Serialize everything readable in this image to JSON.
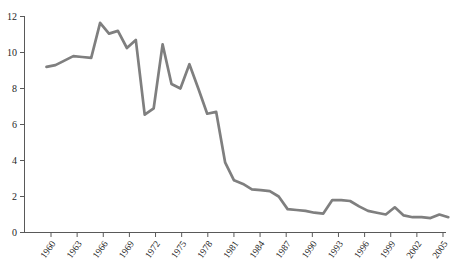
{
  "chart_data": {
    "type": "line",
    "title": "",
    "xlabel": "",
    "ylabel": "",
    "x": [
      1960,
      1961,
      1962,
      1963,
      1964,
      1965,
      1966,
      1967,
      1968,
      1969,
      1970,
      1971,
      1972,
      1973,
      1974,
      1975,
      1976,
      1977,
      1978,
      1979,
      1980,
      1981,
      1982,
      1983,
      1984,
      1985,
      1986,
      1987,
      1988,
      1989,
      1990,
      1991,
      1992,
      1993,
      1994,
      1995,
      1996,
      1997,
      1998,
      1999,
      2000,
      2001,
      2002,
      2003,
      2004,
      2005
    ],
    "values": [
      9.2,
      9.3,
      9.55,
      9.8,
      9.75,
      9.7,
      11.65,
      11.05,
      11.2,
      10.25,
      10.7,
      6.55,
      6.9,
      10.45,
      8.25,
      8.0,
      9.35,
      8.0,
      6.6,
      6.7,
      3.9,
      2.9,
      2.7,
      2.4,
      2.35,
      2.3,
      2.0,
      1.3,
      1.25,
      1.2,
      1.1,
      1.05,
      1.8,
      1.8,
      1.75,
      1.45,
      1.2,
      1.1,
      1.0,
      1.4,
      0.95,
      0.85,
      0.85,
      0.8,
      1.0,
      0.85
    ],
    "xticks": [
      1960,
      1963,
      1966,
      1969,
      1972,
      1975,
      1978,
      1981,
      1984,
      1987,
      1990,
      1993,
      1996,
      1999,
      2002,
      2005
    ],
    "yticks": [
      0,
      2,
      4,
      6,
      8,
      10,
      12
    ],
    "ylim": [
      0,
      12
    ],
    "x_tick_step_years": 3,
    "grid": "off",
    "legend": "none",
    "x_label_rotation_deg": -55,
    "line_color": "#7f7f7f",
    "axis_color": "#595959",
    "label_color": "#262626",
    "background": "#ffffff"
  }
}
